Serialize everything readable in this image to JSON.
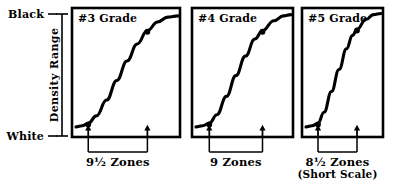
{
  "figure": {
    "type": "diagram",
    "background_color": "#ffffff",
    "ink_color": "#000000"
  },
  "y_axis": {
    "name": "density-range-axis",
    "label": "Density Range",
    "top_label": "Black",
    "bottom_label": "White",
    "tick_count": 2
  },
  "panels": [
    {
      "id": "panel-grade-3",
      "title": "#3 Grade",
      "zone_label": "9½ Zones",
      "zone_sublabel": "",
      "x": 72,
      "y": 8,
      "width": 108,
      "height": 129,
      "toe_marker": {
        "x": 0.12,
        "y": 0.93
      },
      "shoulder_marker": {
        "x": 0.7,
        "y": 0.17
      },
      "arrow_left_x": 0.12,
      "arrow_right_x": 0.7
    },
    {
      "id": "panel-grade-4",
      "title": "#4 Grade",
      "zone_label": "9 Zones",
      "zone_sublabel": "",
      "x": 192,
      "y": 8,
      "width": 101,
      "height": 129,
      "toe_marker": {
        "x": 0.14,
        "y": 0.93
      },
      "shoulder_marker": {
        "x": 0.7,
        "y": 0.17
      },
      "arrow_left_x": 0.14,
      "arrow_right_x": 0.7
    },
    {
      "id": "panel-grade-5",
      "title": "#5 Grade",
      "zone_label": "8½ Zones",
      "zone_sublabel": "(Short Scale)",
      "x": 302,
      "y": 8,
      "width": 81,
      "height": 129,
      "toe_marker": {
        "x": 0.16,
        "y": 0.93
      },
      "shoulder_marker": {
        "x": 0.68,
        "y": 0.16
      },
      "arrow_left_x": 0.16,
      "arrow_right_x": 0.68
    }
  ],
  "chart_data": {
    "type": "line",
    "title": "",
    "xlabel": "",
    "ylabel": "Density Range",
    "ylim": [
      0,
      1
    ],
    "ytick_labels": [
      "White",
      "Black"
    ],
    "grid": false,
    "legend": "none",
    "series": [
      {
        "name": "#3 Grade",
        "note": "9½ Zones",
        "x": [
          0.0,
          0.06,
          0.12,
          0.2,
          0.3,
          0.4,
          0.5,
          0.6,
          0.7,
          0.8,
          0.9,
          1.0
        ],
        "y": [
          0.05,
          0.06,
          0.08,
          0.14,
          0.27,
          0.43,
          0.59,
          0.73,
          0.84,
          0.91,
          0.95,
          0.96
        ]
      },
      {
        "name": "#4 Grade",
        "note": "9 Zones",
        "x": [
          0.0,
          0.07,
          0.14,
          0.22,
          0.32,
          0.42,
          0.52,
          0.62,
          0.7,
          0.82,
          0.92,
          1.0
        ],
        "y": [
          0.05,
          0.06,
          0.08,
          0.15,
          0.3,
          0.47,
          0.63,
          0.77,
          0.84,
          0.92,
          0.96,
          0.97
        ]
      },
      {
        "name": "#5 Grade",
        "note": "8½ Zones (Short Scale)",
        "x": [
          0.0,
          0.08,
          0.16,
          0.24,
          0.34,
          0.44,
          0.54,
          0.62,
          0.68,
          0.8,
          0.9,
          1.0
        ],
        "y": [
          0.05,
          0.06,
          0.08,
          0.17,
          0.34,
          0.52,
          0.69,
          0.8,
          0.85,
          0.93,
          0.97,
          0.98
        ]
      }
    ]
  }
}
